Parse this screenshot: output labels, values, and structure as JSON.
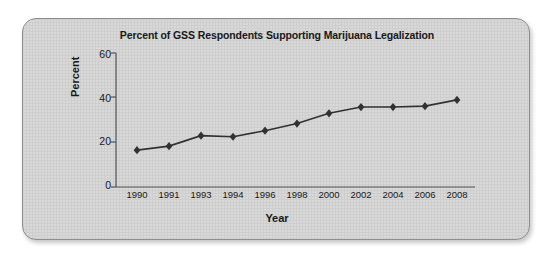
{
  "chart_data": {
    "type": "line",
    "title": "Percent of GSS Respondents Supporting Marijuana Legalization",
    "xlabel": "Year",
    "ylabel": "Percent",
    "categories": [
      "1990",
      "1991",
      "1993",
      "1994",
      "1996",
      "1998",
      "2000",
      "2002",
      "2004",
      "2006",
      "2008"
    ],
    "values": [
      16.5,
      18.3,
      23.0,
      22.5,
      25.2,
      28.4,
      33.0,
      35.8,
      35.8,
      36.2,
      39.0
    ],
    "series": [
      {
        "name": "Percent supporting legalization",
        "values": [
          16.5,
          18.3,
          23.0,
          22.5,
          25.2,
          28.4,
          33.0,
          35.8,
          35.8,
          36.2,
          39.0
        ]
      }
    ],
    "ylim": [
      0,
      60
    ],
    "yticks": [
      "0",
      "20",
      "40",
      "60"
    ],
    "ytick_values": [
      0,
      20,
      40,
      60
    ],
    "grid": false,
    "legend": "none",
    "marker": "diamond",
    "line_color": "#333333",
    "marker_color": "#333333",
    "plot_background": "#d9d9d9"
  },
  "colors": {
    "card_background": "#d9d9d9",
    "card_border": "#8e8e8e",
    "text": "#1a1a1a",
    "axis": "#555555"
  }
}
